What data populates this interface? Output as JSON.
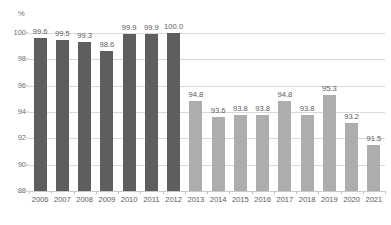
{
  "chart_data": {
    "type": "bar",
    "title": "",
    "xlabel": "",
    "ylabel": "%",
    "unit_label": "%",
    "ylim": [
      88,
      100
    ],
    "yticks": [
      88,
      90,
      92,
      94,
      96,
      98,
      100
    ],
    "ytick_labels": [
      "88",
      "90",
      "92",
      "94",
      "96",
      "98",
      "100"
    ],
    "grid": true,
    "legend": "none",
    "categories": [
      "2006",
      "2007",
      "2008",
      "2009",
      "2010",
      "2011",
      "2012",
      "2013",
      "2014",
      "2015",
      "2016",
      "2017",
      "2018",
      "2019",
      "2020",
      "2021"
    ],
    "values": [
      99.6,
      99.5,
      99.3,
      98.6,
      99.9,
      99.9,
      100.0,
      94.8,
      93.6,
      93.8,
      93.8,
      94.8,
      93.8,
      95.3,
      93.2,
      91.5
    ],
    "value_labels": [
      "99.6",
      "99.5",
      "99.3",
      "98.6",
      "99.9",
      "99.9",
      "100.0",
      "94.8",
      "93.6",
      "93.8",
      "93.8",
      "94.8",
      "93.8",
      "95.3",
      "93.2",
      "91.5"
    ],
    "bar_groups": [
      "dark",
      "dark",
      "dark",
      "dark",
      "dark",
      "dark",
      "dark",
      "light",
      "light",
      "light",
      "light",
      "light",
      "light",
      "light",
      "light",
      "light"
    ],
    "colors": {
      "dark_bar": "#5e5e5e",
      "light_bar": "#adadad",
      "gridline": "#d9d9d9",
      "axis_text": "#5a5a5a",
      "tick_text": "#6e6e6e",
      "background": "#ffffff"
    }
  }
}
